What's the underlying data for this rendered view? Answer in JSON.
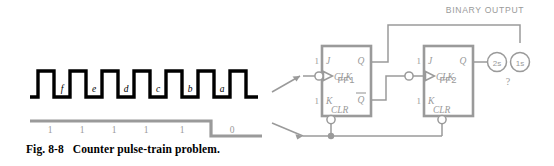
{
  "figure": {
    "caption_number": "Fig. 8-8",
    "caption_text": "Counter pulse-train problem."
  },
  "pulse_train": {
    "label": "clock pulse train",
    "pulse_labels": [
      "f",
      "e",
      "d",
      "c",
      "b",
      "a"
    ],
    "color": "#000000"
  },
  "clear_waveform": {
    "label": "clear input waveform",
    "level_labels": [
      "1",
      "1",
      "1",
      "1",
      "1",
      "0"
    ],
    "color": "#9a9a9a"
  },
  "circuit": {
    "binary_output_label": "BINARY OUTPUT",
    "unknown_label": "?",
    "flipflops": [
      {
        "name": "FF1",
        "j_label": "J",
        "k_label": "K",
        "clk_label": "CLK",
        "clr_label": "CLR",
        "q_label": "Q",
        "qbar_label": "Q",
        "j_input_value": "1",
        "k_input_value": "1"
      },
      {
        "name": "FF2",
        "j_label": "J",
        "k_label": "K",
        "clk_label": "CLK",
        "clr_label": "CLR",
        "q_label": "Q",
        "qbar_label": "Q",
        "j_input_value": "1",
        "k_input_value": "1"
      }
    ],
    "output_bits": [
      {
        "name": "twos-place-output",
        "label": "2s"
      },
      {
        "name": "ones-place-output",
        "label": "1s"
      }
    ],
    "line_color": "#9a9a9a"
  }
}
